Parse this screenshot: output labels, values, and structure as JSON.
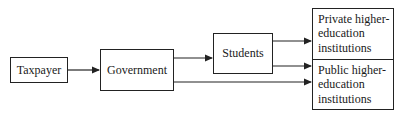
{
  "diagram": {
    "type": "flowchart",
    "direction": "left-to-right",
    "nodes": [
      {
        "id": "taxpayer",
        "label": "Taxpayer"
      },
      {
        "id": "government",
        "label": "Government"
      },
      {
        "id": "students",
        "label": "Students"
      },
      {
        "id": "private",
        "label": "Private higher-\neducation\ninstitutions"
      },
      {
        "id": "public",
        "label": "Public higher-\neducation\ninstitutions"
      }
    ],
    "edges": [
      {
        "from": "taxpayer",
        "to": "government"
      },
      {
        "from": "government",
        "to": "students"
      },
      {
        "from": "government",
        "to": "public"
      },
      {
        "from": "students",
        "to": "private"
      },
      {
        "from": "students",
        "to": "public"
      }
    ]
  },
  "colors": {
    "line": "#222222",
    "background": "#ffffff"
  }
}
